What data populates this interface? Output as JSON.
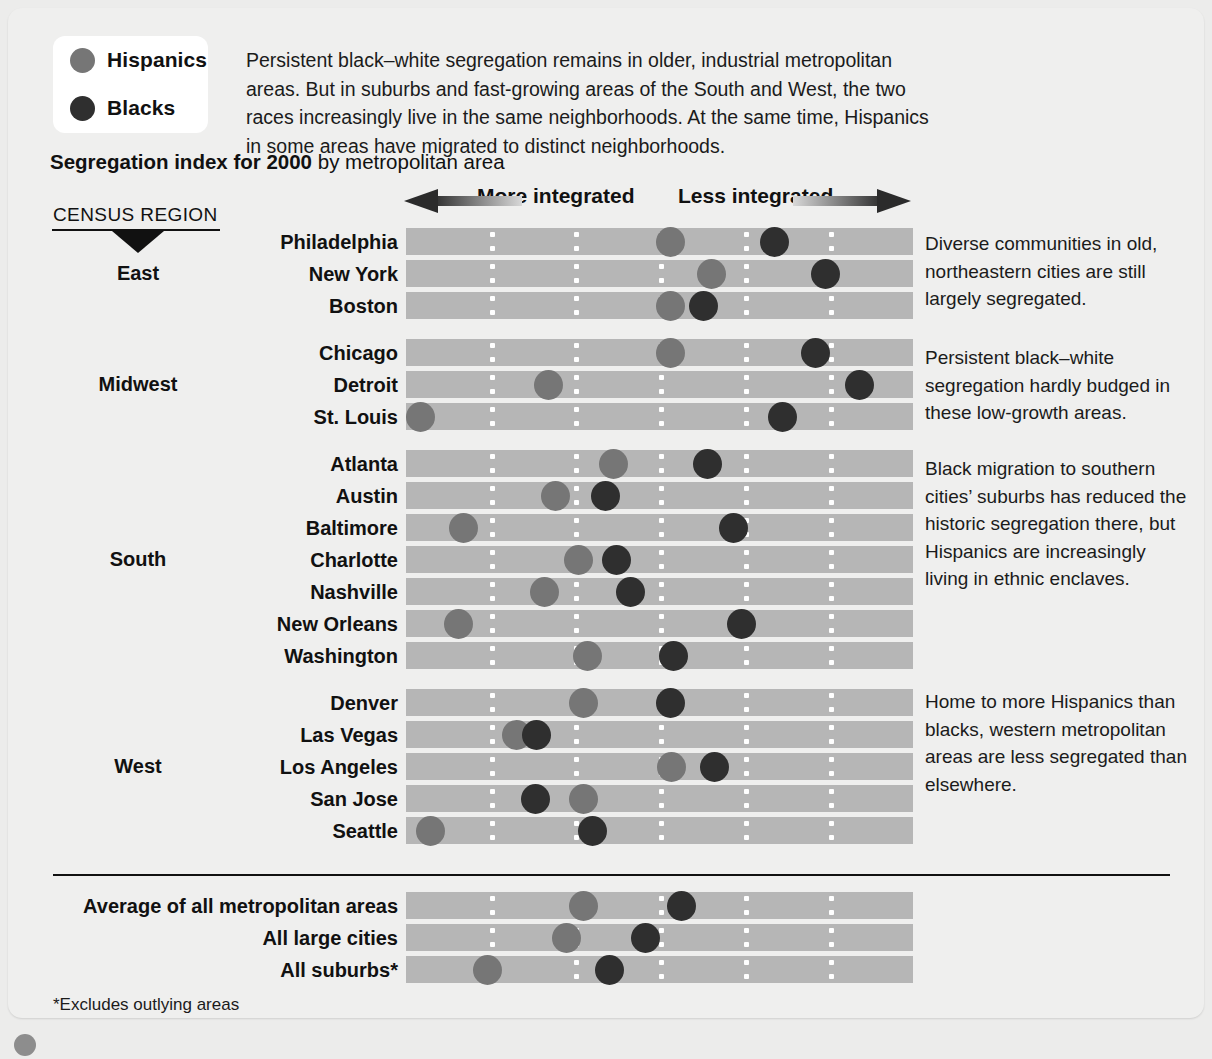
{
  "legend": {
    "items": [
      {
        "label": "Hispanics",
        "color": "#767676",
        "icon": "circle-icon"
      },
      {
        "label": "Blacks",
        "color": "#2f2f2f",
        "icon": "circle-icon"
      }
    ]
  },
  "intro": "Persistent black–white segregation remains in older, industrial metropolitan areas. But in suburbs and fast-growing areas of the South and West, the two races increasingly live in the same neighborhoods. At the same time, Hispanics in some areas have migrated to distinct neighborhoods.",
  "title": {
    "bold": "Segregation index for 2000",
    "rest": " by metropolitan area"
  },
  "census_header": "CENSUS REGION",
  "axis": {
    "left_label": "More integrated",
    "right_label": "Less integrated"
  },
  "footnote": "*Excludes outlying areas",
  "notes": {
    "east": "Diverse communities in old, northeastern cities are still largely segregated.",
    "midwest": "Persistent black–white segregation hardly budged in these low-growth areas.",
    "south": "Black migration to southern cities’ suburbs has reduced the historic segregation there, but Hispanics are increasingly living in ethnic enclaves.",
    "west": "Home to more Hispanics than blacks, western metropolitan areas are less segregated than elsewhere."
  },
  "regions": [
    {
      "name": "East"
    },
    {
      "name": "Midwest"
    },
    {
      "name": "South"
    },
    {
      "name": "West"
    }
  ],
  "chart_data": {
    "type": "scatter",
    "title": "Segregation index for 2000 by metropolitan area",
    "xlabel": "Segregation index (left = more integrated, right = less integrated)",
    "ylabel": "Metropolitan area",
    "legend_position": "top-left",
    "grid": true,
    "axis_note": "Horizontal position along bar encodes the segregation index; 0 = bar left edge, 1 = bar right edge.",
    "series": [
      {
        "name": "Hispanics",
        "color": "#767676"
      },
      {
        "name": "Blacks",
        "color": "#2f2f2f"
      }
    ],
    "gridline_fractions": [
      0.165,
      0.331,
      0.499,
      0.666,
      0.834
    ],
    "groups": [
      {
        "region": "East",
        "rows": [
          {
            "label": "Philadelphia",
            "hispanics": 0.524,
            "blacks": 0.74
          },
          {
            "label": "New York",
            "hispanics": 0.609,
            "blacks": 0.848
          },
          {
            "label": "Boston",
            "hispanics": 0.524,
            "blacks": 0.593
          }
        ]
      },
      {
        "region": "Midwest",
        "rows": [
          {
            "label": "Chicago",
            "hispanics": 0.524,
            "blacks": 0.826
          },
          {
            "label": "Detroit",
            "hispanics": 0.268,
            "blacks": 0.918
          },
          {
            "label": "St. Louis",
            "hispanics": 0.0,
            "blacks": 0.757
          }
        ]
      },
      {
        "region": "South",
        "rows": [
          {
            "label": "Atlanta",
            "hispanics": 0.404,
            "blacks": 0.6
          },
          {
            "label": "Austin",
            "hispanics": 0.283,
            "blacks": 0.387
          },
          {
            "label": "Baltimore",
            "hispanics": 0.09,
            "blacks": 0.655
          },
          {
            "label": "Charlotte",
            "hispanics": 0.331,
            "blacks": 0.41
          },
          {
            "label": "Nashville",
            "hispanics": 0.26,
            "blacks": 0.439
          },
          {
            "label": "New Orleans",
            "hispanics": 0.08,
            "blacks": 0.672
          },
          {
            "label": "Washington",
            "hispanics": 0.35,
            "blacks": 0.53
          }
        ]
      },
      {
        "region": "West",
        "rows": [
          {
            "label": "Denver",
            "hispanics": 0.34,
            "blacks": 0.523
          },
          {
            "label": "Las Vegas",
            "hispanics": 0.2,
            "blacks": 0.243
          },
          {
            "label": "Los Angeles",
            "hispanics": 0.525,
            "blacks": 0.615
          },
          {
            "label": "San Jose",
            "hispanics": 0.34,
            "blacks": 0.24
          },
          {
            "label": "Seattle",
            "hispanics": 0.02,
            "blacks": 0.36
          }
        ]
      }
    ],
    "summary_rows": [
      {
        "label": "Average of all metropolitan areas",
        "hispanics": 0.34,
        "blacks": 0.545
      },
      {
        "label": "All large cities",
        "hispanics": 0.305,
        "blacks": 0.47
      },
      {
        "label": "All suburbs*",
        "hispanics": 0.14,
        "blacks": 0.395
      }
    ]
  }
}
